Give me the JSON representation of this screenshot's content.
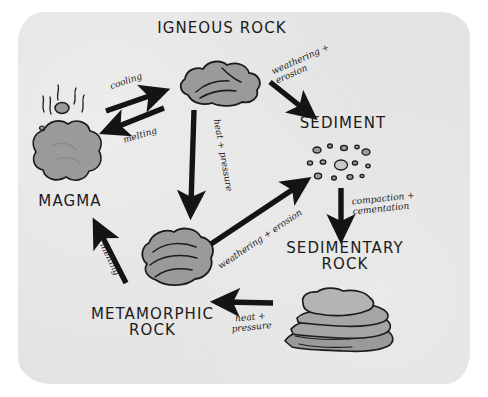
{
  "diagram": {
    "paper_color": "#e3e3e3",
    "ink_color": "#1b1b1b",
    "rock_fill": "#9a9a9a"
  },
  "nodes": {
    "igneous": {
      "label": "IGNEOUS ROCK",
      "icon": "igneous-rock-blob"
    },
    "magma": {
      "label": "MAGMA",
      "icon": "magma-blob"
    },
    "sediment": {
      "label": "SEDIMENT",
      "icon": "sediment-grains"
    },
    "sedimentary": {
      "label": "SEDIMENTARY\nROCK",
      "icon": "sedimentary-rock-layers"
    },
    "metamorphic": {
      "label": "METAMORPHIC\nROCK",
      "icon": "metamorphic-rock-blob"
    }
  },
  "arrows": {
    "magma_to_igneous": {
      "label": "cooling",
      "from": "MAGMA",
      "to": "IGNEOUS ROCK"
    },
    "igneous_to_magma": {
      "label": "melting",
      "from": "IGNEOUS ROCK",
      "to": "MAGMA"
    },
    "igneous_to_sediment": {
      "label": "weathering +\nerosion",
      "from": "IGNEOUS ROCK",
      "to": "SEDIMENT"
    },
    "igneous_to_metamorphic": {
      "label": "heat + pressure",
      "from": "IGNEOUS ROCK",
      "to": "METAMORPHIC ROCK"
    },
    "sediment_to_sedimentary": {
      "label": "compaction +\ncementation",
      "from": "SEDIMENT",
      "to": "SEDIMENTARY ROCK"
    },
    "sedimentary_to_metamorphic": {
      "label": "heat +\npressure",
      "from": "SEDIMENTARY ROCK",
      "to": "METAMORPHIC ROCK"
    },
    "metamorphic_to_sediment": {
      "label": "weathering + erosion",
      "from": "METAMORPHIC ROCK",
      "to": "SEDIMENT"
    },
    "metamorphic_to_magma": {
      "label": "melting",
      "from": "METAMORPHIC ROCK",
      "to": "MAGMA"
    }
  }
}
